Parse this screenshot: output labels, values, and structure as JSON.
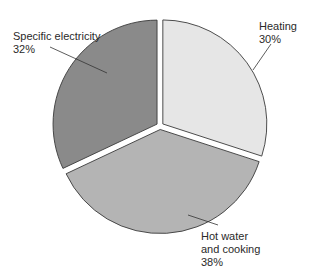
{
  "chart_data": {
    "type": "pie",
    "title": "",
    "categories": [
      "Heating",
      "Hot water and cooking",
      "Specific electricity"
    ],
    "values": [
      30,
      38,
      32
    ],
    "unit": "%",
    "colors": [
      "#e6e6e6",
      "#b4b4b4",
      "#8a8a8a"
    ],
    "start_angle_deg": 0,
    "direction": "clockwise",
    "exploded": true,
    "legend": "none (direct labels with leader lines)"
  },
  "labels": {
    "heating": {
      "name": "Heating",
      "pct": "30%"
    },
    "hot_water": {
      "line1": "Hot water",
      "line2": "and cooking",
      "pct": "38%"
    },
    "electricity": {
      "name": "Specific electricity",
      "pct": "32%"
    }
  }
}
